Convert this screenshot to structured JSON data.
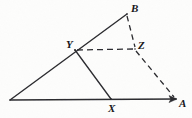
{
  "figure": {
    "kind": "geometry-diagram",
    "canvas": {
      "width": 192,
      "height": 118
    },
    "stroke_color": "#2a2a2e",
    "background_color": "#fdfdfc",
    "points": [
      {
        "id": "O",
        "label": "",
        "x": 10,
        "y": 100,
        "labeled": false
      },
      {
        "id": "X",
        "label": "X",
        "x": 111,
        "y": 99,
        "labeled": true,
        "label_x": 108,
        "label_y": 103
      },
      {
        "id": "A",
        "label": "A",
        "x": 177,
        "y": 99,
        "labeled": true,
        "label_x": 179,
        "label_y": 98
      },
      {
        "id": "Y",
        "label": "Y",
        "x": 75,
        "y": 50,
        "labeled": true,
        "label_x": 66,
        "label_y": 39
      },
      {
        "id": "B",
        "label": "B",
        "x": 127,
        "y": 14,
        "labeled": true,
        "label_x": 131,
        "label_y": 3
      },
      {
        "id": "Z",
        "label": "Z",
        "x": 135,
        "y": 49,
        "labeled": true,
        "label_x": 138,
        "label_y": 40
      }
    ],
    "segments": [
      {
        "id": "base-OA",
        "from": "O",
        "to": "A",
        "style": "solid",
        "arrow_end": true
      },
      {
        "id": "side-OB",
        "from": "O",
        "to": "B",
        "style": "solid",
        "arrow_end": false
      },
      {
        "id": "cevian-YX",
        "from": "Y",
        "to": "X",
        "style": "solid",
        "arrow_end": false
      },
      {
        "id": "dash-YZ",
        "from": "Y",
        "to": "Z",
        "style": "dashed",
        "arrow_end": false
      },
      {
        "id": "dash-BZ",
        "from": "B",
        "to": "Z",
        "style": "dashed",
        "arrow_end": false
      },
      {
        "id": "dash-ZA",
        "from": "Z",
        "to": "A",
        "style": "dashed",
        "arrow_end": false
      }
    ],
    "labels": {
      "A": "A",
      "B": "B",
      "X": "X",
      "Y": "Y",
      "Z": "Z"
    }
  }
}
